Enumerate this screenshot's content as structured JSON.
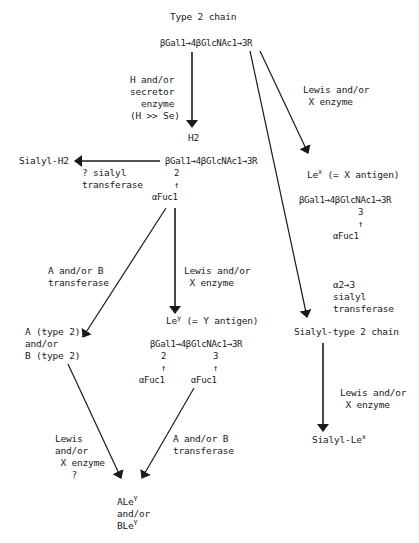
{
  "title": "Type 2 chain",
  "nodes": {
    "root": "βGal1→4βGlcNAc1→3R",
    "h2_label": "H2",
    "h2_structure": "βGal1→4βGlcNAc1→3R",
    "h2_link": "2",
    "h2_arrow": "↑",
    "h2_fuc": "αFuc1",
    "sialyl_h2": "Sialyl-H2",
    "lex_label": "Le",
    "lex_sup": "x",
    "lex_suffix": " (= X antigen)",
    "lex_structure": "βGal1→4βGlcNAc1→3R",
    "lex_link": "3",
    "lex_arrow": "↑",
    "lex_fuc": "αFuc1",
    "ab_type2_line1": "A (type 2)",
    "ab_type2_line2": "and/or",
    "ab_type2_line3": "B (type 2)",
    "ley_label": "Le",
    "ley_sup": "y",
    "ley_suffix": " (= Y antigen)",
    "ley_structure": "βGal1→4βGlcNAc1→3R",
    "ley_link2": "2",
    "ley_link3": "3",
    "ley_arrow": "↑",
    "ley_fuc": "αFuc1",
    "sialyl_type2": "Sialyl-type 2 chain",
    "sialyl_lex_label": "Sialyl-Le",
    "sialyl_lex_sup": "x",
    "aley_label": "ALe",
    "aley_sup": "Y",
    "aley_and": "and/or",
    "bley_label": "BLe",
    "bley_sup": "Y"
  },
  "enzymes": {
    "h_secretor": [
      "H and/or",
      "secretor",
      "  enzyme",
      "(H >> Se)"
    ],
    "lewis_x_top": [
      "Lewis and/or",
      " X enzyme"
    ],
    "sialyl_q": [
      "? sialyl",
      "transferase"
    ],
    "ab_transferase_left": [
      "A and/or B",
      "transferase"
    ],
    "lewis_x_mid": [
      "Lewis and/or",
      " X enzyme"
    ],
    "a23_sialyl": [
      "α2→3",
      "sialyl",
      "transferase"
    ],
    "lewis_x_right": [
      "Lewis and/or",
      " X enzyme"
    ],
    "lewis_x_bottom": [
      "Lewis",
      "and/or",
      " X enzyme",
      "   ?"
    ],
    "ab_transferase_bottom": [
      "A and/or B",
      "transferase"
    ]
  },
  "colors": {
    "ink": "#1a1a1a",
    "background": "#ffffff"
  }
}
